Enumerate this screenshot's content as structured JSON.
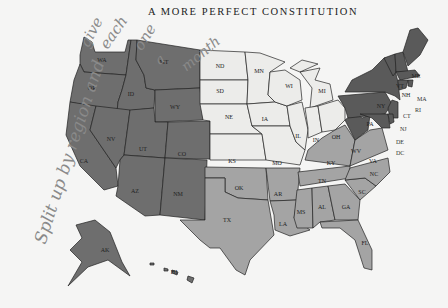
{
  "page": {
    "header": "A MORE PERFECT CONSTITUTION"
  },
  "annotation": {
    "handwritten_lines": [
      "Split up by region and",
      "give",
      "each",
      "one",
      "a",
      "month"
    ]
  },
  "map": {
    "colors": {
      "west": "#6e6e6e",
      "midwest": "#ececea",
      "south": "#a4a4a4",
      "northeast": "#5a5a5a",
      "border": "#222222"
    },
    "regions": {
      "west": [
        "WA",
        "OR",
        "CA",
        "NV",
        "ID",
        "MT",
        "WY",
        "UT",
        "CO",
        "AZ",
        "NM",
        "AK",
        "HI"
      ],
      "midwest": [
        "ND",
        "SD",
        "NE",
        "KS",
        "MN",
        "IA",
        "MO",
        "WI",
        "IL",
        "MI",
        "IN",
        "OH"
      ],
      "south": [
        "OK",
        "TX",
        "AR",
        "LA",
        "MS",
        "AL",
        "TN",
        "KY",
        "GA",
        "FL",
        "SC",
        "NC",
        "VA"
      ],
      "northeast": [
        "ME",
        "NH",
        "VT",
        "MA",
        "RI",
        "CT",
        "NY",
        "NJ",
        "PA",
        "DE",
        "MD",
        "DC",
        "WV"
      ]
    },
    "labels": {
      "WA": "WA",
      "OR": "OR",
      "CA": "CA",
      "NV": "NV",
      "ID": "ID",
      "MT": "MT",
      "WY": "WY",
      "UT": "UT",
      "CO": "CO",
      "AZ": "AZ",
      "NM": "NM",
      "AK": "AK",
      "HI": "HI",
      "ND": "ND",
      "SD": "SD",
      "NE": "NE",
      "KS": "KS",
      "MN": "MN",
      "IA": "IA",
      "MO": "MO",
      "WI": "WI",
      "IL": "IL",
      "MI": "MI",
      "IN": "IN",
      "OH": "OH",
      "OK": "OK",
      "TX": "TX",
      "AR": "AR",
      "LA": "LA",
      "MS": "MS",
      "AL": "AL",
      "TN": "TN",
      "KY": "KY",
      "GA": "GA",
      "FL": "FL",
      "SC": "SC",
      "NC": "NC",
      "VA": "VA",
      "ME": "ME",
      "NH": "NH",
      "VT": "VT",
      "MA": "MA",
      "RI": "RI",
      "CT": "CT",
      "NY": "NY",
      "NJ": "NJ",
      "PA": "PA",
      "DE": "DE",
      "MD": "MD",
      "DC": "DC",
      "WV": "WV"
    }
  }
}
